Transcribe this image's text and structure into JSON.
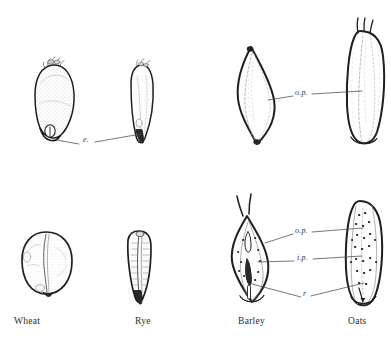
{
  "figure": {
    "kind": "botanical-illustration",
    "ink_color": "#1f1f1f",
    "stipple_color": "#8a8a8a",
    "background": "#ffffff"
  },
  "captions": [
    {
      "id": "wheat",
      "label": "Wheat",
      "x": 14,
      "y": 316
    },
    {
      "id": "rye",
      "label": "Rye",
      "x": 135,
      "y": 316
    },
    {
      "id": "barley",
      "label": "Barley",
      "x": 238,
      "y": 316
    },
    {
      "id": "oats",
      "label": "Oats",
      "x": 348,
      "y": 316
    }
  ],
  "annotations": [
    {
      "id": "embryo",
      "label": "e.",
      "x": 83,
      "y": 140
    },
    {
      "id": "outer-palea-top",
      "label": "o.p.",
      "x": 297,
      "y": 94
    },
    {
      "id": "outer-palea-bottom",
      "label": "o.p.",
      "x": 297,
      "y": 232
    },
    {
      "id": "inner-palea",
      "label": "i.p.",
      "x": 299,
      "y": 259
    },
    {
      "id": "rachilla",
      "label": "r",
      "x": 305,
      "y": 295
    }
  ],
  "specimens": [
    {
      "id": "wheat-dorsal",
      "name": "Wheat — dorsal view",
      "row": "top",
      "column": 1
    },
    {
      "id": "rye-dorsal",
      "name": "Rye — dorsal view",
      "row": "top",
      "column": 2
    },
    {
      "id": "barley-dorsal",
      "name": "Barley — dorsal view (hulled)",
      "row": "top",
      "column": 3
    },
    {
      "id": "oats-dorsal",
      "name": "Oats — dorsal view (hulled)",
      "row": "top",
      "column": 4
    },
    {
      "id": "wheat-ventral",
      "name": "Wheat — ventral view",
      "row": "bottom",
      "column": 1
    },
    {
      "id": "rye-ventral",
      "name": "Rye — ventral view",
      "row": "bottom",
      "column": 2
    },
    {
      "id": "barley-ventral",
      "name": "Barley — ventral view",
      "row": "bottom",
      "column": 3
    },
    {
      "id": "oats-ventral",
      "name": "Oats — ventral view",
      "row": "bottom",
      "column": 4
    }
  ]
}
